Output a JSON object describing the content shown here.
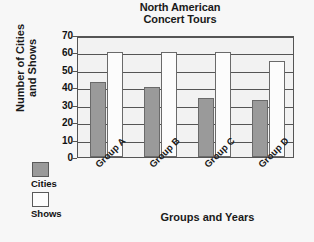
{
  "chart_data": {
    "type": "bar",
    "title": "North American Concert Tours",
    "title_lines": [
      "North American",
      "Concert Tours"
    ],
    "xlabel": "Groups and Years",
    "ylabel": "Number of Cities and Shows",
    "ylabel_lines": [
      "Number of Cities",
      "and Shows"
    ],
    "categories": [
      "Group A",
      "Group B",
      "Group C",
      "Group D"
    ],
    "series": [
      {
        "name": "Cities",
        "values": [
          43,
          40,
          34,
          33
        ],
        "color": "#9a9a9a"
      },
      {
        "name": "Shows",
        "values": [
          60,
          60,
          60,
          55
        ],
        "color": "#fcfcfc"
      }
    ],
    "ylim": [
      0,
      70
    ],
    "ytick_values": [
      0,
      10,
      20,
      30,
      40,
      50,
      60,
      70
    ],
    "ytick_labels": [
      "0",
      "10",
      "20",
      "30",
      "40",
      "50",
      "60",
      "70"
    ],
    "grid": true,
    "legend_position": "lower-left-outside",
    "xtick_rotation": -45
  },
  "legend": {
    "entries": [
      {
        "label": "Cities",
        "swatch": "cities"
      },
      {
        "label": "Shows",
        "swatch": "shows"
      }
    ]
  }
}
